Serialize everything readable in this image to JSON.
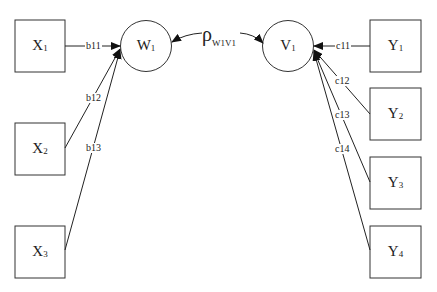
{
  "diagram": {
    "type": "path-diagram",
    "exogenous": [
      {
        "id": "X1",
        "letter": "X",
        "index": "1"
      },
      {
        "id": "X2",
        "letter": "X",
        "index": "2"
      },
      {
        "id": "X3",
        "letter": "X",
        "index": "3"
      }
    ],
    "latent": [
      {
        "id": "W1",
        "letter": "W",
        "index": "1"
      },
      {
        "id": "V1",
        "letter": "V",
        "index": "1"
      }
    ],
    "indicators": [
      {
        "id": "Y1",
        "letter": "Y",
        "index": "1"
      },
      {
        "id": "Y2",
        "letter": "Y",
        "index": "2"
      },
      {
        "id": "Y3",
        "letter": "Y",
        "index": "3"
      },
      {
        "id": "Y4",
        "letter": "Y",
        "index": "4"
      }
    ],
    "edges": [
      {
        "from": "X1",
        "to": "W1",
        "label": "b11"
      },
      {
        "from": "X2",
        "to": "W1",
        "label": "b12"
      },
      {
        "from": "X3",
        "to": "W1",
        "label": "b13"
      },
      {
        "from": "Y1",
        "to": "V1",
        "label": "c11"
      },
      {
        "from": "Y2",
        "to": "V1",
        "label": "c12"
      },
      {
        "from": "Y3",
        "to": "V1",
        "label": "c13"
      },
      {
        "from": "Y4",
        "to": "V1",
        "label": "c14"
      }
    ],
    "correlation": {
      "symbol": "ρ",
      "subscript": "W1V1",
      "between": [
        "W1",
        "V1"
      ]
    }
  }
}
